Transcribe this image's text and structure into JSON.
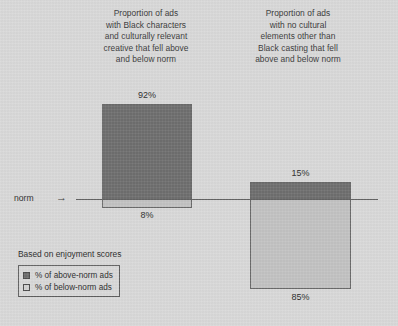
{
  "chart_data": {
    "type": "bar",
    "title": "",
    "subtitle": "",
    "xlabel": "",
    "ylabel": "",
    "grid": false,
    "legend_position": "bottom-left",
    "baseline_label": "norm",
    "baseline_arrow": "→",
    "footnote": "Based on enjoyment scores",
    "categories": [
      "Proportion of ads with Black characters and culturally relevant creative that fell above and below norm",
      "Proportion of ads with no cultural elements other than Black casting that fell above and below norm"
    ],
    "category_titles": [
      [
        "Proportion of ads",
        "with Black characters",
        "and culturally relevant",
        "creative that fell above",
        "and below norm"
      ],
      [
        "Proportion of ads",
        "with no cultural",
        "elements other than",
        "Black casting that fell",
        "above and below norm"
      ]
    ],
    "series": [
      {
        "name": "% of above-norm ads",
        "values": [
          92,
          15
        ],
        "labels": [
          "92%",
          "15%"
        ],
        "color": "#6e6e6e"
      },
      {
        "name": "% of below-norm ads",
        "values": [
          8,
          85
        ],
        "labels": [
          "8%",
          "85%"
        ],
        "color": "#c2c2c2"
      }
    ],
    "legend": [
      {
        "label": "% of above-norm ads",
        "color": "#6e6e6e"
      },
      {
        "label": "% of below-norm ads",
        "color": "#d2d2d2"
      }
    ],
    "colors": {
      "background": "#d9d9d9",
      "above_norm": "#6e6e6e",
      "below_norm": "#c2c2c2",
      "text": "#2b2b2b",
      "baseline": "#5a5a5a"
    }
  }
}
